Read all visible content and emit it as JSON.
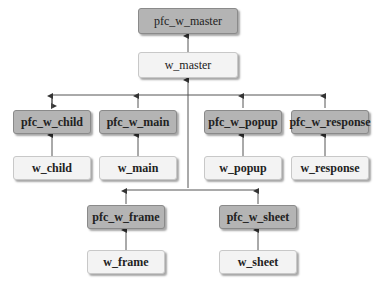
{
  "diagram": {
    "colors": {
      "ancestor_fill": "#b4b4b4",
      "descendant_fill": "#f3f3f3",
      "line": "#555555"
    },
    "nodes": {
      "pfc_w_master": "pfc_w_master",
      "w_master": "w_master",
      "pfc_w_child": "pfc_w_child",
      "w_child": "w_child",
      "pfc_w_main": "pfc_w_main",
      "w_main": "w_main",
      "pfc_w_popup": "pfc_w_popup",
      "w_popup": "w_popup",
      "pfc_w_response": "pfc_w_response",
      "w_response": "w_response",
      "pfc_w_frame": "pfc_w_frame",
      "w_frame": "w_frame",
      "pfc_w_sheet": "pfc_w_sheet",
      "w_sheet": "w_sheet"
    },
    "edges": [
      [
        "w_master",
        "pfc_w_master"
      ],
      [
        "pfc_w_child",
        "w_master"
      ],
      [
        "pfc_w_main",
        "w_master"
      ],
      [
        "pfc_w_popup",
        "w_master"
      ],
      [
        "pfc_w_response",
        "w_master"
      ],
      [
        "pfc_w_frame",
        "w_master"
      ],
      [
        "pfc_w_sheet",
        "w_master"
      ],
      [
        "w_child",
        "pfc_w_child"
      ],
      [
        "w_main",
        "pfc_w_main"
      ],
      [
        "w_popup",
        "pfc_w_popup"
      ],
      [
        "w_response",
        "pfc_w_response"
      ],
      [
        "w_frame",
        "pfc_w_frame"
      ],
      [
        "w_sheet",
        "pfc_w_sheet"
      ]
    ]
  }
}
